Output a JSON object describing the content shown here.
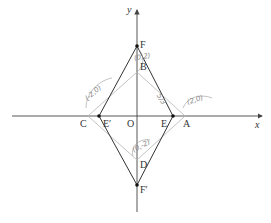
{
  "axes": {
    "x_label": "x",
    "y_label": "y",
    "origin_label": "O"
  },
  "points": {
    "F": "F",
    "F_prime": "F′",
    "B": "B",
    "D": "D",
    "A": "A",
    "C": "C",
    "E": "E",
    "E_prime": "E′"
  },
  "annotations": {
    "A_coord": "(2,0)",
    "C_coord": "(-2,0)",
    "D_coord": "(0,-2)",
    "B_coord": "(0,2)",
    "side_note": "5/3"
  },
  "colors": {
    "axis": "#444444",
    "rhombus": "#333333",
    "square": "#b0b0b0",
    "handwriting": "#8a8a8a"
  }
}
